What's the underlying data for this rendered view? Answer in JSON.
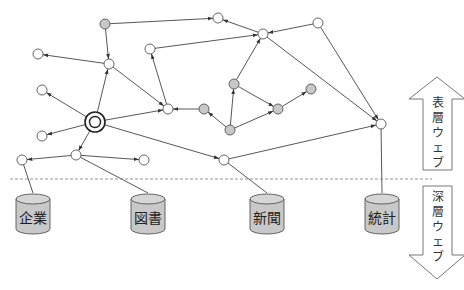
{
  "diagram": {
    "nodes": [
      {
        "id": "n1",
        "type": "gray"
      },
      {
        "id": "n2",
        "type": "white"
      },
      {
        "id": "n3",
        "type": "white"
      },
      {
        "id": "n4",
        "type": "white"
      },
      {
        "id": "n5",
        "type": "white"
      },
      {
        "id": "n6",
        "type": "white"
      },
      {
        "id": "n7",
        "type": "white"
      },
      {
        "id": "n8",
        "type": "white"
      },
      {
        "id": "n9",
        "type": "white"
      },
      {
        "id": "n10",
        "type": "gray"
      },
      {
        "id": "n11",
        "type": "gray"
      },
      {
        "id": "n12",
        "type": "gray"
      },
      {
        "id": "n13",
        "type": "gray"
      },
      {
        "id": "n14",
        "type": "gray"
      },
      {
        "id": "start",
        "type": "target"
      },
      {
        "id": "n15",
        "type": "white"
      },
      {
        "id": "n16",
        "type": "white"
      },
      {
        "id": "n17",
        "type": "white"
      },
      {
        "id": "n18",
        "type": "white"
      },
      {
        "id": "n19",
        "type": "white"
      },
      {
        "id": "n20",
        "type": "white"
      }
    ],
    "edges": [
      {
        "from": "n1",
        "to": "n2"
      },
      {
        "from": "n1",
        "to": "n6"
      },
      {
        "from": "n3",
        "to": "n2"
      },
      {
        "from": "n4",
        "to": "n3"
      },
      {
        "from": "n7",
        "to": "n3"
      },
      {
        "from": "n6",
        "to": "n5"
      },
      {
        "from": "n6",
        "to": "n9"
      },
      {
        "from": "n9",
        "to": "n7"
      },
      {
        "from": "n10",
        "to": "n9"
      },
      {
        "from": "n12",
        "to": "n10"
      },
      {
        "from": "n12",
        "to": "n11"
      },
      {
        "from": "n11",
        "to": "n3"
      },
      {
        "from": "n11",
        "to": "n13"
      },
      {
        "from": "n12",
        "to": "n13"
      },
      {
        "from": "n13",
        "to": "n14"
      },
      {
        "from": "n3",
        "to": "n20"
      },
      {
        "from": "n4",
        "to": "n20"
      },
      {
        "from": "start",
        "to": "n6"
      },
      {
        "from": "start",
        "to": "n8"
      },
      {
        "from": "start",
        "to": "n9"
      },
      {
        "from": "start",
        "to": "n15"
      },
      {
        "from": "start",
        "to": "n16"
      },
      {
        "from": "start",
        "to": "n19"
      },
      {
        "from": "n16",
        "to": "n17"
      },
      {
        "from": "n16",
        "to": "n18"
      },
      {
        "from": "n19",
        "to": "n20"
      }
    ],
    "plain_links": [
      {
        "from": "n17",
        "to": "db1"
      },
      {
        "from": "n16",
        "to": "db2"
      },
      {
        "from": "n19",
        "to": "db3"
      },
      {
        "from": "n20",
        "to": "db4"
      }
    ],
    "databases": [
      {
        "id": "db1",
        "label": "企業"
      },
      {
        "id": "db2",
        "label": "図書"
      },
      {
        "id": "db3",
        "label": "新聞"
      },
      {
        "id": "db4",
        "label": "統計"
      }
    ],
    "surface_web": {
      "label": "表層ウェブ",
      "chars": [
        "表",
        "層",
        "ウ",
        "ェ",
        "ブ"
      ]
    },
    "deep_web": {
      "label": "深層ウェブ",
      "chars": [
        "深",
        "層",
        "ウ",
        "ェ",
        "ブ"
      ]
    },
    "colors": {
      "gray_node": "#c8c8c8",
      "white_node": "#ffffff",
      "edge": "#444444"
    }
  }
}
